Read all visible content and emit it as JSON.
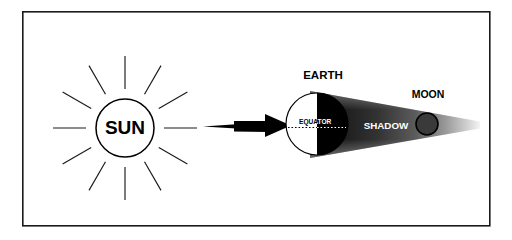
{
  "diagram": {
    "type": "astronomy-schematic",
    "background_color": "#ffffff",
    "frame": {
      "name": "diagram-border",
      "stroke_color": "#1a1a1a",
      "fill_color": "#ffffff",
      "x": 22,
      "y": 11,
      "width": 468,
      "height": 215,
      "stroke_width": 1.6
    },
    "sun": {
      "label": "SUN",
      "label_color": "#000000",
      "outline_color": "#000000",
      "fill_color": "#ffffff",
      "cx": 125,
      "cy": 128,
      "r": 29,
      "ray_count": 12,
      "ray_color": "#1a1a1a",
      "ray_inner_offset": 10,
      "ray_length": 33
    },
    "arrow": {
      "name": "sunlight-arrow",
      "color": "#000000",
      "x_start": 203,
      "x_end": 290,
      "y": 125
    },
    "earth": {
      "label": "EARTH",
      "label_color": "#000000",
      "cx": 317,
      "cy": 124,
      "r": 31,
      "lit_side_color": "#ffffff",
      "dark_side_color": "#000000",
      "outline_color": "#000000",
      "equator": {
        "label": "EQUATOR",
        "lit_text_color": "#000000",
        "dark_text_color": "#ffffff",
        "dash_color_lit": "#000000",
        "dash_color_dark": "#ffffff"
      }
    },
    "shadow": {
      "label": "SHADOW",
      "label_color": "#ffffff",
      "near_color": "#111111",
      "far_color": "#f2f2f2",
      "apex_x": 480,
      "base_x": 317,
      "base_half_height": 33
    },
    "moon": {
      "label": "MOON",
      "label_color": "#000000",
      "fill_color": "#3a3a3a",
      "outline_color": "#000000",
      "cx": 427,
      "cy": 124,
      "r": 11
    }
  }
}
